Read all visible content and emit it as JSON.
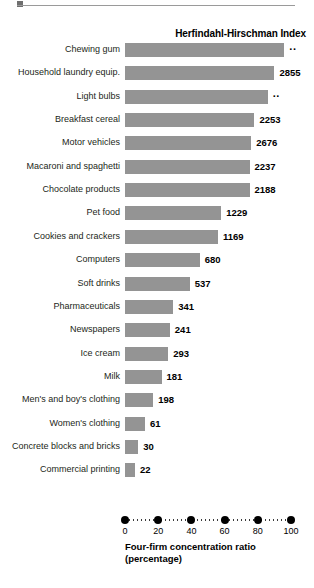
{
  "top_rule": {
    "marker_icon": "square-marker-icon"
  },
  "chart_data": {
    "type": "bar",
    "orientation": "horizontal",
    "title": "Herfindahl-Hirschman Index",
    "xlabel": "Four-firm concentration ratio (percentage)",
    "xlabel_line1": "Four-firm concentration ratio",
    "xlabel_line2": "(percentage)",
    "ylabel": "",
    "xlim": [
      0,
      100
    ],
    "xticks": [
      0,
      20,
      40,
      60,
      80,
      100
    ],
    "xtick_labels": [
      "0",
      "20",
      "40",
      "60",
      "80",
      "100"
    ],
    "grid": false,
    "legend": "none",
    "bar_color": "#949494",
    "categories": [
      "Chewing gum",
      "Household laundry equip.",
      "Light bulbs",
      "Breakfast cereal",
      "Motor vehicles",
      "Macaroni and spaghetti",
      "Chocolate products",
      "Pet food",
      "Cookies and crackers",
      "Computers",
      "Soft drinks",
      "Pharmaceuticals",
      "Newspapers",
      "Ice cream",
      "Milk",
      "Men's and boy's clothing",
      "Women's clothing",
      "Concrete blocks and bricks",
      "Commercial printing"
    ],
    "values": [
      96,
      90,
      86,
      78,
      76,
      75,
      75,
      58,
      56,
      45,
      39,
      29,
      27,
      26,
      22,
      17,
      12,
      8,
      6
    ],
    "hhi_labels": [
      "..",
      "2855",
      "..",
      "2253",
      "2676",
      "2237",
      "2188",
      "1229",
      "1169",
      "680",
      "537",
      "341",
      "241",
      "293",
      "181",
      "198",
      "61",
      "30",
      "22"
    ],
    "hhi_values": [
      null,
      2855,
      null,
      2253,
      2676,
      2237,
      2188,
      1229,
      1169,
      680,
      537,
      341,
      241,
      293,
      181,
      198,
      61,
      30,
      22
    ],
    "note": "Bar length encodes the four-firm concentration ratio (percentage); the bold number at the end of each bar is the Herfindahl-Hirschman Index, where '..' means not available."
  }
}
